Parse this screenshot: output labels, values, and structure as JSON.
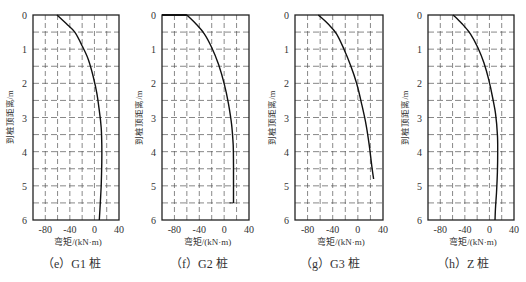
{
  "chart_data": [
    {
      "type": "line",
      "title": "",
      "caption": "（e）G1 桩",
      "xlabel": "弯矩/(kN·m)",
      "ylabel": "到桩顶距离/m",
      "xlim": [
        -100,
        40
      ],
      "ylim": [
        0,
        6
      ],
      "y_inverted": true,
      "xticks": [
        -80,
        -40,
        0,
        40
      ],
      "yticks": [
        0,
        1,
        2,
        3,
        4,
        5,
        6
      ],
      "grid": "dashed, 20 kN·m x 0.5 m",
      "series": [
        {
          "name": "G1",
          "x": [
            -61,
            -46,
            -32,
            -20,
            -10,
            -2,
            4,
            8,
            11,
            12,
            12,
            11,
            9.5,
            8
          ],
          "y": [
            0,
            0.25,
            0.5,
            0.9,
            1.3,
            1.8,
            2.3,
            2.8,
            3.3,
            3.8,
            4.3,
            5.0,
            5.5,
            6.0
          ]
        }
      ]
    },
    {
      "type": "line",
      "title": "",
      "caption": "（f）G2 桩",
      "xlabel": "弯矩/(kN·m)",
      "ylabel": "到桩顶距离/m",
      "xlim": [
        -100,
        40
      ],
      "ylim": [
        0,
        6
      ],
      "y_inverted": true,
      "xticks": [
        -80,
        -40,
        0,
        40
      ],
      "yticks": [
        0,
        1,
        2,
        3,
        4,
        5,
        6
      ],
      "grid": "dashed, 20 kN·m x 0.5 m",
      "series": [
        {
          "name": "G2",
          "x": [
            -60,
            -46,
            -32,
            -20,
            -9,
            0,
            7,
            12,
            14.5,
            15,
            15,
            15
          ],
          "y": [
            0,
            0.25,
            0.55,
            0.95,
            1.45,
            2.0,
            2.6,
            3.2,
            3.8,
            4.4,
            5.0,
            5.5
          ]
        }
      ]
    },
    {
      "type": "line",
      "title": "",
      "caption": "（g）G3 桩",
      "xlabel": "弯矩/(kN·m)",
      "ylabel": "到桩顶距离/m",
      "xlim": [
        -100,
        40
      ],
      "ylim": [
        0,
        6
      ],
      "y_inverted": true,
      "xticks": [
        -80,
        -40,
        0,
        40
      ],
      "yticks": [
        0,
        1,
        2,
        3,
        4,
        5,
        6
      ],
      "grid": "dashed, 20 kN·m x 0.5 m",
      "series": [
        {
          "name": "G3",
          "x": [
            -63,
            -48,
            -34,
            -22,
            -11,
            -2,
            6,
            13,
            18,
            22,
            25
          ],
          "y": [
            0,
            0.25,
            0.55,
            1.0,
            1.5,
            2.0,
            2.6,
            3.2,
            3.8,
            4.4,
            4.8
          ]
        }
      ]
    },
    {
      "type": "line",
      "title": "",
      "caption": "（h）Z 桩",
      "xlabel": "弯矩/(kN·m)",
      "ylabel": "到桩顶距离/m",
      "xlim": [
        -100,
        40
      ],
      "ylim": [
        0,
        6
      ],
      "y_inverted": true,
      "xticks": [
        -80,
        -40,
        0,
        40
      ],
      "yticks": [
        0,
        1,
        2,
        3,
        4,
        5,
        6
      ],
      "grid": "dashed, 20 kN·m x 0.5 m",
      "series": [
        {
          "name": "Z",
          "x": [
            -59,
            -45,
            -31,
            -19,
            -9,
            -1,
            5,
            10,
            13,
            13.5,
            13,
            11.5,
            10,
            9
          ],
          "y": [
            0,
            0.25,
            0.55,
            0.95,
            1.4,
            1.9,
            2.4,
            2.9,
            3.5,
            4.0,
            4.6,
            5.2,
            5.6,
            6.0
          ]
        }
      ]
    }
  ],
  "panels": [
    {
      "caption": "（e）G1 桩",
      "xlabel": "弯矩/(kN·m)",
      "ylabel": "到桩顶距离/m"
    },
    {
      "caption": "（f）G2 桩",
      "xlabel": "弯矩/(kN·m)",
      "ylabel": "到桩顶距离/m"
    },
    {
      "caption": "（g）G3 桩",
      "xlabel": "弯矩/(kN·m)",
      "ylabel": "到桩顶距离/m"
    },
    {
      "caption": "（h）Z 桩",
      "xlabel": "弯矩/(kN·m)",
      "ylabel": "到桩顶距离/m"
    }
  ],
  "layout": {
    "frames": [
      {
        "left": 33,
        "right": 119,
        "top": 15,
        "bottom": 220,
        "caption_x": 42
      },
      {
        "left": 162,
        "right": 249,
        "top": 15,
        "bottom": 220,
        "caption_x": 170
      },
      {
        "left": 295,
        "right": 383,
        "top": 15,
        "bottom": 220,
        "caption_x": 300
      },
      {
        "left": 428,
        "right": 514,
        "top": 15,
        "bottom": 220,
        "caption_x": 437
      }
    ],
    "colors": {
      "frame": "#222222",
      "grid": "#555555",
      "curve": "#111111",
      "text": "#333333"
    }
  }
}
